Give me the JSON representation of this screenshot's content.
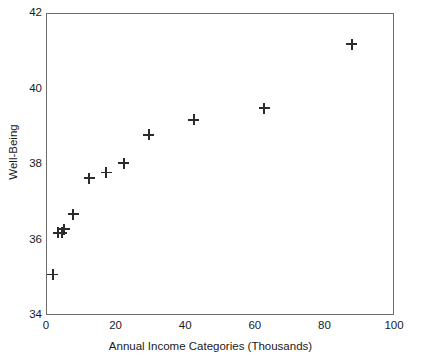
{
  "chart_data": {
    "type": "scatter",
    "title": "",
    "xlabel": "Annual Income Categories (Thousands)",
    "ylabel": "Well-Being",
    "xlim": [
      0,
      100
    ],
    "ylim": [
      34,
      42
    ],
    "xticks": [
      0,
      20,
      40,
      60,
      80,
      100
    ],
    "xtick_labels": [
      "0",
      "20",
      "40",
      "60",
      "80",
      "100"
    ],
    "yticks": [
      34,
      36,
      38,
      40,
      42
    ],
    "ytick_labels": [
      "34",
      "36",
      "38",
      "40",
      "42"
    ],
    "grid": false,
    "legend": null,
    "marker": "plus",
    "marker_color": "#2b2b2b",
    "frame_color": "#6d6d6d",
    "background": "#ffffff",
    "series": [
      {
        "name": "Well-Being by income category",
        "points": [
          {
            "x": 1.7,
            "y": 35.1
          },
          {
            "x": 3.2,
            "y": 36.2
          },
          {
            "x": 4.3,
            "y": 36.2
          },
          {
            "x": 4.9,
            "y": 36.3
          },
          {
            "x": 7.5,
            "y": 36.7
          },
          {
            "x": 12.1,
            "y": 37.65
          },
          {
            "x": 17.0,
            "y": 37.8
          },
          {
            "x": 22.1,
            "y": 38.05
          },
          {
            "x": 29.3,
            "y": 38.8
          },
          {
            "x": 42.2,
            "y": 39.2
          },
          {
            "x": 62.4,
            "y": 39.5
          },
          {
            "x": 87.6,
            "y": 41.2
          }
        ]
      }
    ]
  }
}
